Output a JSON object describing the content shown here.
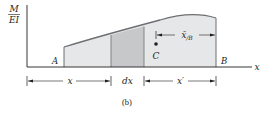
{
  "diagram": {
    "y_axis_label_top": "M",
    "y_axis_label_bottom": "EI",
    "x_axis_label": "x",
    "point_a": "A",
    "point_b": "B",
    "centroid_label": "C",
    "centroid_distance_label": "x̄",
    "centroid_distance_subscript": "B",
    "centroid_distance_pre_subscript": "/",
    "dim_x": "x",
    "dim_dx": "dx",
    "dim_x_prime": "x′",
    "caption": "(b)"
  },
  "colors": {
    "line": "#231f20",
    "curve": "#6d6e71",
    "area_fill": "#e6e7e8",
    "strip_fill": "#c7c8ca"
  }
}
